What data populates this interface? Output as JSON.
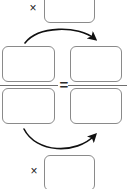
{
  "diagram": {
    "type": "proportion-cross-multiply",
    "equals_symbol": "=",
    "multiply_symbol": "×",
    "stroke_color": "#8a8a8a",
    "arrow_color": "#111111",
    "background_color": "#ffffff",
    "boxes": {
      "top_answer": {
        "label": "",
        "placeholder": ""
      },
      "left_numerator": {
        "label": "",
        "placeholder": ""
      },
      "left_denominator": {
        "label": "",
        "placeholder": ""
      },
      "right_numerator": {
        "label": "",
        "placeholder": ""
      },
      "right_denominator": {
        "label": "",
        "placeholder": ""
      },
      "bottom_answer": {
        "label": "",
        "placeholder": ""
      }
    },
    "arrows": [
      {
        "name": "top-cross-arrow",
        "from": "left-numerator",
        "to": "right-numerator",
        "direction": "left-to-right",
        "curve": "arc-over"
      },
      {
        "name": "bottom-cross-arrow",
        "from": "left-denominator",
        "to": "right-denominator",
        "direction": "left-to-right",
        "curve": "arc-under"
      }
    ]
  }
}
